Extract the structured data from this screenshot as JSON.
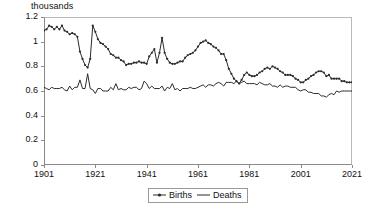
{
  "axis_unit_title": "thousands",
  "legend": {
    "entries": [
      {
        "label": "Births",
        "marker": "line-with-point-marker",
        "color": "#2b2b2b"
      },
      {
        "label": "Deaths",
        "marker": "plain-line",
        "color": "#2b2b2b"
      }
    ]
  },
  "yaxis": {
    "ticks": [
      "0",
      "0.2",
      "0.4",
      "0.6",
      "0.8",
      "1",
      "1.2"
    ],
    "min": 0,
    "max": 1.2
  },
  "xaxis": {
    "ticks": [
      "1901",
      "1921",
      "1941",
      "1961",
      "1981",
      "2001",
      "2021"
    ],
    "min": 1901,
    "max": 2021
  },
  "chart_data": {
    "type": "line",
    "title": "",
    "subtitle": "",
    "xlabel": "",
    "ylabel": "thousands",
    "xlim": [
      1901,
      2021
    ],
    "ylim": [
      0,
      1.2
    ],
    "grid": false,
    "legend_position": "bottom-center",
    "x": [
      1901,
      1902,
      1903,
      1904,
      1905,
      1906,
      1907,
      1908,
      1909,
      1910,
      1911,
      1912,
      1913,
      1914,
      1915,
      1916,
      1917,
      1918,
      1919,
      1920,
      1921,
      1922,
      1923,
      1924,
      1925,
      1926,
      1927,
      1928,
      1929,
      1930,
      1931,
      1932,
      1933,
      1934,
      1935,
      1936,
      1937,
      1938,
      1939,
      1940,
      1941,
      1942,
      1943,
      1944,
      1945,
      1946,
      1947,
      1948,
      1949,
      1950,
      1951,
      1952,
      1953,
      1954,
      1955,
      1956,
      1957,
      1958,
      1959,
      1960,
      1961,
      1962,
      1963,
      1964,
      1965,
      1966,
      1967,
      1968,
      1969,
      1970,
      1971,
      1972,
      1973,
      1974,
      1975,
      1976,
      1977,
      1978,
      1979,
      1980,
      1981,
      1982,
      1983,
      1984,
      1985,
      1986,
      1987,
      1988,
      1989,
      1990,
      1991,
      1992,
      1993,
      1994,
      1995,
      1996,
      1997,
      1998,
      1999,
      2000,
      2001,
      2002,
      2003,
      2004,
      2005,
      2006,
      2007,
      2008,
      2009,
      2010,
      2011,
      2012,
      2013,
      2014,
      2015,
      2016,
      2017,
      2018,
      2019,
      2020,
      2021
    ],
    "series": [
      {
        "name": "Births",
        "marker": "point",
        "color": "#2b2b2b",
        "values": [
          1.09,
          1.1,
          1.13,
          1.12,
          1.1,
          1.12,
          1.1,
          1.13,
          1.09,
          1.08,
          1.06,
          1.07,
          1.06,
          1.04,
          0.92,
          0.86,
          0.81,
          0.79,
          0.86,
          1.13,
          1.08,
          1.02,
          0.99,
          0.98,
          0.96,
          0.94,
          0.9,
          0.89,
          0.87,
          0.87,
          0.85,
          0.84,
          0.81,
          0.82,
          0.82,
          0.83,
          0.83,
          0.84,
          0.83,
          0.83,
          0.82,
          0.88,
          0.91,
          0.94,
          0.83,
          0.91,
          1.03,
          0.91,
          0.86,
          0.83,
          0.82,
          0.82,
          0.83,
          0.84,
          0.84,
          0.87,
          0.89,
          0.9,
          0.91,
          0.93,
          0.96,
          0.99,
          1.0,
          1.01,
          0.99,
          0.98,
          0.96,
          0.95,
          0.93,
          0.9,
          0.9,
          0.85,
          0.78,
          0.74,
          0.7,
          0.68,
          0.66,
          0.69,
          0.73,
          0.75,
          0.73,
          0.72,
          0.72,
          0.73,
          0.75,
          0.76,
          0.78,
          0.79,
          0.78,
          0.8,
          0.79,
          0.78,
          0.76,
          0.75,
          0.73,
          0.73,
          0.73,
          0.72,
          0.7,
          0.69,
          0.67,
          0.67,
          0.69,
          0.7,
          0.72,
          0.73,
          0.75,
          0.76,
          0.76,
          0.75,
          0.72,
          0.73,
          0.7,
          0.7,
          0.7,
          0.7,
          0.68,
          0.68,
          0.67,
          0.67,
          0.67
        ]
      },
      {
        "name": "Deaths",
        "marker": "none",
        "color": "#2b2b2b",
        "values": [
          0.63,
          0.62,
          0.61,
          0.63,
          0.62,
          0.62,
          0.62,
          0.63,
          0.61,
          0.6,
          0.64,
          0.61,
          0.63,
          0.63,
          0.69,
          0.62,
          0.62,
          0.74,
          0.62,
          0.61,
          0.58,
          0.62,
          0.62,
          0.6,
          0.6,
          0.6,
          0.63,
          0.61,
          0.66,
          0.61,
          0.62,
          0.61,
          0.61,
          0.63,
          0.62,
          0.63,
          0.63,
          0.61,
          0.62,
          0.68,
          0.66,
          0.62,
          0.64,
          0.62,
          0.62,
          0.62,
          0.64,
          0.6,
          0.63,
          0.62,
          0.66,
          0.61,
          0.62,
          0.6,
          0.62,
          0.62,
          0.62,
          0.63,
          0.62,
          0.62,
          0.63,
          0.64,
          0.65,
          0.63,
          0.65,
          0.65,
          0.64,
          0.66,
          0.67,
          0.66,
          0.64,
          0.67,
          0.67,
          0.67,
          0.66,
          0.68,
          0.66,
          0.67,
          0.68,
          0.66,
          0.66,
          0.66,
          0.66,
          0.65,
          0.67,
          0.66,
          0.65,
          0.65,
          0.66,
          0.64,
          0.64,
          0.63,
          0.65,
          0.63,
          0.64,
          0.64,
          0.63,
          0.63,
          0.63,
          0.61,
          0.6,
          0.61,
          0.61,
          0.59,
          0.59,
          0.58,
          0.58,
          0.58,
          0.56,
          0.56,
          0.55,
          0.57,
          0.58,
          0.57,
          0.6,
          0.59,
          0.6,
          0.6,
          0.6,
          0.6,
          0.6
        ]
      }
    ]
  }
}
